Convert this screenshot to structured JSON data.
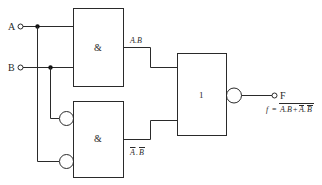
{
  "diagram": {
    "type": "logic-circuit",
    "inputs": [
      {
        "label": "A"
      },
      {
        "label": "B"
      }
    ],
    "gates": [
      {
        "id": "and-top",
        "symbol": "&",
        "output_label": "A.B"
      },
      {
        "id": "and-bottom",
        "symbol": "&",
        "output_label": "Ā̄ B̄",
        "inverted_inputs": true,
        "output_label_parts": [
          "A",
          ".",
          "B"
        ],
        "output_label_overlined": true
      },
      {
        "id": "or-nor",
        "symbol": "1",
        "inverted_output": true
      }
    ],
    "output": {
      "label": "F"
    },
    "formula": {
      "lhs": "f",
      "eq": "=",
      "term1": "A.B",
      "plus": "+",
      "term2_a": "A",
      "term2_dot": ".",
      "term2_b": "B"
    },
    "colors": {
      "line": "#2a2a2a",
      "background": "#ffffff"
    }
  }
}
